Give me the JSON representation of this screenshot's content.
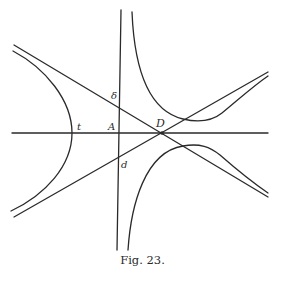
{
  "figure": {
    "caption": "Fig. 23.",
    "labels": {
      "delta": "δ",
      "t": "t",
      "A": "A",
      "D": "D",
      "d": "d"
    },
    "stroke_color": "#2a2a2a",
    "background": "#ffffff"
  }
}
